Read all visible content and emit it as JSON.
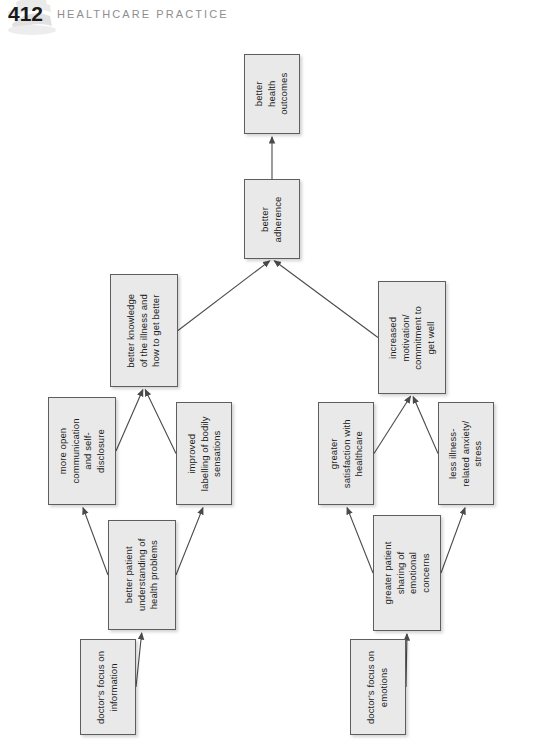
{
  "running_head": {
    "page_number": "412",
    "title": "HEALTHCARE PRACTICE",
    "decoration_icon": "book-stack-watermark-icon"
  },
  "side_caption": {
    "text": "Adapted from Roter & Hall, 1992"
  },
  "chart_data": {
    "type": "diagram",
    "subtype": "flowchart",
    "orientation": "rotated-90-ccw",
    "title": "",
    "nodes": [
      {
        "id": "doctor-focus-information",
        "label": "doctor's focus on\ninformation",
        "x": 80,
        "y": 605,
        "w": 56,
        "h": 96
      },
      {
        "id": "doctor-focus-emotions",
        "label": "doctor's focus on\nemotions",
        "x": 350,
        "y": 605,
        "w": 56,
        "h": 96
      },
      {
        "id": "better-patient-understanding",
        "label": "better patient\nunderstanding of\nhealth problems",
        "x": 108,
        "y": 486,
        "w": 68,
        "h": 110
      },
      {
        "id": "greater-patient-sharing",
        "label": "greater patient\nsharing of\nemotional\nconcerns",
        "x": 373,
        "y": 481,
        "w": 68,
        "h": 116
      },
      {
        "id": "more-open-communication",
        "label": "more open\ncommunication\nand self-\ndisclosure",
        "x": 48,
        "y": 363,
        "w": 68,
        "h": 108
      },
      {
        "id": "improved-labelling",
        "label": "improved\nlabelling of bodily\nsensations",
        "x": 176,
        "y": 368,
        "w": 56,
        "h": 103
      },
      {
        "id": "greater-satisfaction",
        "label": "greater\nsatisfaction with\nhealthcare",
        "x": 318,
        "y": 368,
        "w": 56,
        "h": 103
      },
      {
        "id": "less-illness-anxiety",
        "label": "less illness-\nrelated anxiety/\nstress",
        "x": 438,
        "y": 368,
        "w": 56,
        "h": 103
      },
      {
        "id": "better-knowledge",
        "label": "better knowledge\nof the illness and\nhow to get better",
        "x": 110,
        "y": 240,
        "w": 68,
        "h": 113
      },
      {
        "id": "increased-motivation",
        "label": "increased\nmotivation/\ncommitment to\nget well",
        "x": 378,
        "y": 247,
        "w": 68,
        "h": 113
      },
      {
        "id": "better-adherence",
        "label": "better\nadherence",
        "x": 244,
        "y": 145,
        "w": 56,
        "h": 80
      },
      {
        "id": "better-health-outcomes",
        "label": "better\nhealth\noutcomes",
        "x": 244,
        "y": 20,
        "w": 56,
        "h": 80
      }
    ],
    "edges": [
      {
        "from": "doctor-focus-information",
        "to": "better-patient-understanding"
      },
      {
        "from": "doctor-focus-emotions",
        "to": "greater-patient-sharing"
      },
      {
        "from": "better-patient-understanding",
        "to": "more-open-communication"
      },
      {
        "from": "better-patient-understanding",
        "to": "improved-labelling"
      },
      {
        "from": "greater-patient-sharing",
        "to": "greater-satisfaction"
      },
      {
        "from": "greater-patient-sharing",
        "to": "less-illness-anxiety"
      },
      {
        "from": "more-open-communication",
        "to": "better-knowledge"
      },
      {
        "from": "improved-labelling",
        "to": "better-knowledge"
      },
      {
        "from": "greater-satisfaction",
        "to": "increased-motivation"
      },
      {
        "from": "less-illness-anxiety",
        "to": "increased-motivation"
      },
      {
        "from": "better-knowledge",
        "to": "better-adherence"
      },
      {
        "from": "increased-motivation",
        "to": "better-adherence"
      },
      {
        "from": "better-adherence",
        "to": "better-health-outcomes"
      }
    ],
    "node_fill": "#e9e9e9",
    "node_border": "#5e5e5e",
    "edge_color": "#4a4a4a"
  }
}
